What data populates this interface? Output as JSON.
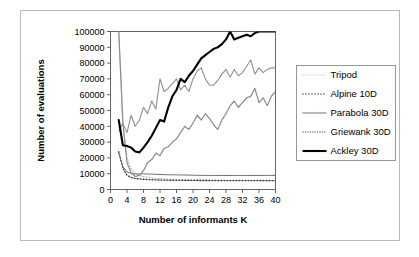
{
  "figure": {
    "border_color": "#b9b9b9",
    "background": "#ffffff"
  },
  "chart_data": {
    "type": "line",
    "title": "",
    "xlabel": "Number of informants K",
    "ylabel": "Number of evaluations",
    "xlim": [
      0,
      40
    ],
    "ylim": [
      0,
      100000
    ],
    "xticks": [
      0,
      4,
      8,
      12,
      16,
      20,
      24,
      28,
      32,
      36,
      40
    ],
    "xtick_labels": [
      "0",
      "4",
      "8",
      "12",
      "16",
      "20",
      "24",
      "28",
      "32",
      "36",
      "40"
    ],
    "yticks": [
      0,
      10000,
      20000,
      30000,
      40000,
      50000,
      60000,
      70000,
      80000,
      90000,
      100000
    ],
    "ytick_labels": [
      "0",
      "10000",
      "20000",
      "30000",
      "40000",
      "50000",
      "60000",
      "70000",
      "80000",
      "90000",
      "100000"
    ],
    "grid": false,
    "legend_position": "right-outside",
    "x": [
      2,
      3,
      4,
      5,
      6,
      7,
      8,
      9,
      10,
      11,
      12,
      13,
      14,
      15,
      16,
      17,
      18,
      19,
      20,
      21,
      22,
      23,
      24,
      25,
      26,
      27,
      28,
      29,
      30,
      31,
      32,
      33,
      34,
      35,
      36,
      37,
      38,
      39,
      40
    ],
    "series": [
      {
        "name": "Tripod",
        "style": "dotted",
        "color": "#b0b0b0",
        "width": 1.1,
        "values": [
          100000,
          42000,
          20000,
          13000,
          10000,
          8800,
          8200,
          7800,
          7400,
          7100,
          6900,
          6700,
          6600,
          6500,
          6400,
          6300,
          6250,
          6200,
          6150,
          6100,
          6050,
          6000,
          6000,
          5950,
          5950,
          5900,
          5900,
          5900,
          5900,
          5900,
          5900,
          5900,
          5880,
          5880,
          5870,
          5870,
          5860,
          5860,
          5850
        ]
      },
      {
        "name": "Alpine 10D",
        "style": "dotted",
        "color": "#333333",
        "width": 1.3,
        "values": [
          24000,
          13500,
          9000,
          7600,
          7000,
          6700,
          6500,
          6300,
          6200,
          6100,
          6000,
          5950,
          5900,
          5850,
          5800,
          5800,
          5780,
          5760,
          5740,
          5720,
          5700,
          5700,
          5680,
          5680,
          5660,
          5660,
          5650,
          5650,
          5640,
          5640,
          5630,
          5630,
          5620,
          5620,
          5620,
          5610,
          5610,
          5600,
          5600
        ]
      },
      {
        "name": "Parabola 30D",
        "style": "solid",
        "color": "#707070",
        "width": 1.0,
        "values": [
          23000,
          14500,
          11200,
          10200,
          9900,
          9850,
          9900,
          9800,
          9700,
          9600,
          9500,
          9400,
          9350,
          9300,
          9250,
          9200,
          9150,
          9100,
          9050,
          9000,
          8950,
          8950,
          8900,
          8900,
          8900,
          8850,
          8850,
          8850,
          8850,
          8850,
          8850,
          8850,
          8870,
          8880,
          8890,
          8900,
          8910,
          8920,
          8930
        ]
      },
      {
        "name": "Griewank 30D",
        "style": "dense-dotted",
        "color": "#8a8a8a",
        "width": 1.3,
        "values": [
          100000,
          42000,
          17000,
          10500,
          8200,
          9000,
          12000,
          17000,
          19000,
          23000,
          21500,
          26000,
          27000,
          30000,
          32000,
          36000,
          40000,
          38000,
          42000,
          47000,
          44000,
          48000,
          45000,
          41000,
          38000,
          44000,
          48000,
          53000,
          56000,
          52000,
          55000,
          58000,
          59000,
          64000,
          55000,
          58000,
          53000,
          59000,
          62000
        ]
      },
      {
        "name": "Ackley 30D",
        "style": "solid",
        "color": "#000000",
        "width": 2.1,
        "values": [
          44000,
          28000,
          27500,
          26500,
          24000,
          23500,
          26500,
          30000,
          34000,
          39000,
          44000,
          43000,
          52000,
          59000,
          63000,
          70000,
          68000,
          72000,
          75000,
          79000,
          83000,
          85000,
          87000,
          89000,
          90000,
          92000,
          95000,
          100000,
          95000,
          96000,
          97000,
          98000,
          97000,
          99000,
          100000,
          100000,
          100000,
          100000,
          100000
        ]
      }
    ],
    "secondary_series": [
      {
        "name": "Parabola 30D",
        "style": "solid",
        "color": "#909090",
        "width": 1.1,
        "values": [
          37000,
          42000,
          36000,
          47000,
          40000,
          44000,
          52000,
          48000,
          56000,
          51000,
          70000,
          62000,
          64000,
          67000,
          70000,
          63000,
          66000,
          62000,
          70000,
          75000,
          77000,
          70000,
          66000,
          66000,
          69000,
          73000,
          76000,
          71000,
          76000,
          72000,
          74000,
          78000,
          82000,
          73000,
          77000,
          74000,
          76000,
          77000,
          77000
        ]
      }
    ]
  },
  "legend": {
    "items": [
      {
        "label": "Tripod"
      },
      {
        "label": "Alpine 10D"
      },
      {
        "label": "Parabola 30D"
      },
      {
        "label": "Griewank 30D"
      },
      {
        "label": "Ackley 30D"
      }
    ]
  }
}
